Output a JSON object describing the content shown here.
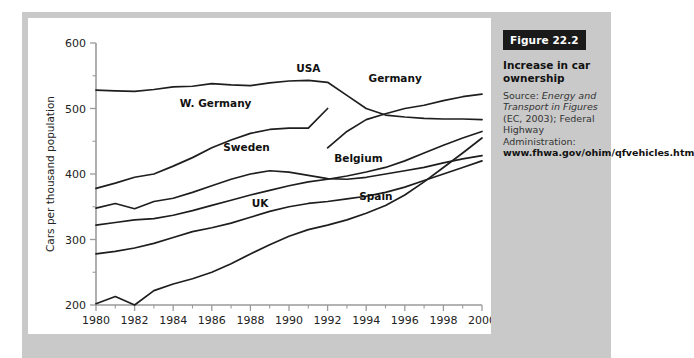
{
  "figure": {
    "badge": "Figure 22.2",
    "title": "Increase in car ownership",
    "source_prefix": "Source: ",
    "source_italic_1": "Energy and Transport in Figures",
    "source_rest_1": " (EC, 2003); Federal Highway Administration:",
    "source_url_line1": "www.fhwa.gov/",
    "source_url_line2": "ohim/qfvehicles.htm"
  },
  "chart_data": {
    "type": "line",
    "title": "Increase in car ownership",
    "xlabel": "",
    "ylabel": "Cars per thousand population",
    "xlim": [
      1980,
      2000
    ],
    "ylim": [
      200,
      600
    ],
    "xticks": [
      1980,
      1982,
      1984,
      1986,
      1988,
      1990,
      1992,
      1994,
      1996,
      1998,
      2000
    ],
    "yticks": [
      200,
      300,
      400,
      500,
      600
    ],
    "grid": false,
    "legend": "inline-labels",
    "x": [
      1980,
      1981,
      1982,
      1983,
      1984,
      1985,
      1986,
      1987,
      1988,
      1989,
      1990,
      1991,
      1992,
      1993,
      1994,
      1995,
      1996,
      1997,
      1998,
      1999,
      2000
    ],
    "series": [
      {
        "name": "USA",
        "label": "USA",
        "values": [
          528,
          527,
          526,
          529,
          533,
          534,
          538,
          536,
          535,
          539,
          542,
          543,
          540,
          520,
          500,
          490,
          487,
          485,
          484,
          484,
          483
        ],
        "label_x": 1991,
        "label_y": 556
      },
      {
        "name": "W. Germany",
        "label": "W. Germany",
        "values": [
          378,
          386,
          395,
          400,
          412,
          425,
          440,
          452,
          462,
          468,
          470,
          470,
          500,
          null,
          null,
          null,
          null,
          null,
          null,
          null,
          null
        ],
        "label_x": 1986.2,
        "label_y": 502
      },
      {
        "name": "Germany",
        "label": "Germany",
        "values": [
          null,
          null,
          null,
          null,
          null,
          null,
          null,
          null,
          null,
          null,
          null,
          null,
          440,
          465,
          483,
          492,
          500,
          505,
          512,
          518,
          522
        ],
        "label_x": 1995.5,
        "label_y": 541
      },
      {
        "name": "Sweden",
        "label": "Sweden",
        "values": [
          348,
          355,
          347,
          358,
          363,
          372,
          382,
          392,
          400,
          405,
          403,
          398,
          393,
          392,
          395,
          400,
          405,
          410,
          417,
          423,
          428
        ],
        "label_x": 1987.8,
        "label_y": 435
      },
      {
        "name": "Belgium",
        "label": "Belgium",
        "values": [
          322,
          326,
          330,
          332,
          337,
          344,
          352,
          360,
          368,
          375,
          382,
          388,
          392,
          397,
          403,
          410,
          420,
          432,
          444,
          455,
          465
        ],
        "label_x": 1993.6,
        "label_y": 418
      },
      {
        "name": "UK",
        "label": "UK",
        "values": [
          278,
          282,
          287,
          294,
          303,
          312,
          318,
          325,
          334,
          343,
          350,
          355,
          358,
          362,
          366,
          372,
          380,
          390,
          400,
          410,
          420
        ],
        "label_x": 1988.5,
        "label_y": 350
      },
      {
        "name": "Spain",
        "label": "Spain",
        "values": [
          202,
          213,
          200,
          222,
          232,
          240,
          250,
          263,
          278,
          292,
          305,
          315,
          322,
          330,
          340,
          352,
          368,
          388,
          410,
          432,
          455
        ],
        "label_x": 1994.5,
        "label_y": 360
      }
    ]
  }
}
